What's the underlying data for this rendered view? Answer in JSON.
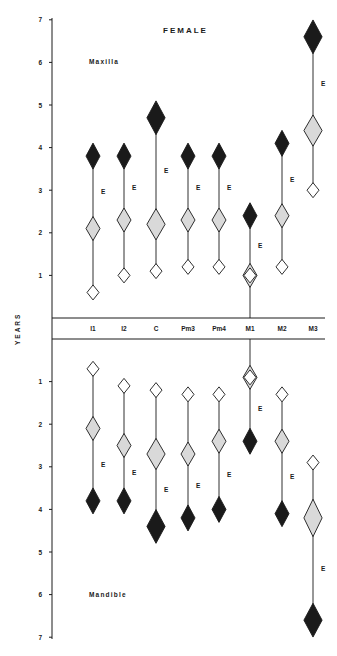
{
  "chart_data": {
    "type": "scatter",
    "title": "FEMALE",
    "ylabel": "YEARS",
    "xlabel": "",
    "categories": [
      "I1",
      "I2",
      "C",
      "Pm3",
      "Pm4",
      "M1",
      "M2",
      "M3"
    ],
    "panels": [
      {
        "name": "Maxilla",
        "ylim": [
          0,
          7
        ],
        "yticks": [
          1,
          2,
          3,
          4,
          5,
          6,
          7
        ],
        "series": [
          {
            "name": "Initial (open diamond)",
            "values": [
              0.6,
              1.0,
              1.1,
              1.2,
              1.2,
              1.0,
              1.2,
              3.0
            ]
          },
          {
            "name": "Mean (stippled diamond)",
            "values": [
              2.1,
              2.3,
              2.2,
              2.3,
              2.3,
              1.0,
              2.4,
              4.4
            ]
          },
          {
            "name": "Completion (black diamond)",
            "values": [
              3.8,
              3.8,
              4.7,
              3.8,
              3.8,
              2.4,
              4.1,
              6.6
            ]
          }
        ],
        "eruption_marker": "E"
      },
      {
        "name": "Mandible",
        "ylim": [
          0,
          7
        ],
        "yticks": [
          1,
          2,
          3,
          4,
          5,
          6,
          7
        ],
        "series": [
          {
            "name": "Initial (open diamond)",
            "values": [
              0.7,
              1.1,
              1.2,
              1.3,
              1.3,
              0.9,
              1.3,
              2.9
            ]
          },
          {
            "name": "Mean (stippled diamond)",
            "values": [
              2.1,
              2.5,
              2.7,
              2.7,
              2.4,
              0.9,
              2.4,
              4.2
            ]
          },
          {
            "name": "Completion (black diamond)",
            "values": [
              3.8,
              3.8,
              4.4,
              4.2,
              4.0,
              2.4,
              4.1,
              6.6
            ]
          }
        ],
        "eruption_marker": "E"
      }
    ],
    "legend_position": "none",
    "grid": false
  },
  "labels": {
    "title": "FEMALE",
    "yaxis": "YEARS",
    "maxilla": "Maxilla",
    "mandible": "Mandible",
    "eruption": "E"
  },
  "colors": {
    "ink": "#1a1a1a",
    "stipple": "#d9d9d9",
    "paper": "#ffffff"
  }
}
